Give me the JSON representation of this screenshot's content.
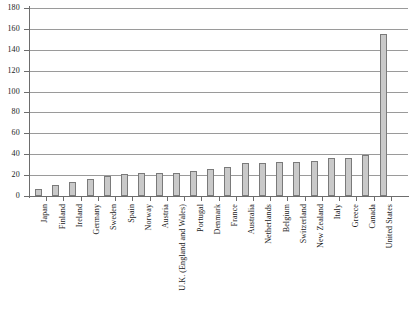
{
  "chart_data": {
    "type": "bar",
    "title": "",
    "subtitle": "",
    "xlabel": "",
    "ylabel": "",
    "ylim": [
      0,
      180
    ],
    "ytick_step": 20,
    "yticks": [
      0,
      20,
      40,
      60,
      80,
      100,
      120,
      140,
      160,
      180
    ],
    "grid": true,
    "legend": "none",
    "orientation": "vertical",
    "bar_fill_color": "#c9c9c9",
    "bar_border_color": "#7a7a7a",
    "axis_color": "#6d6d6d",
    "gridline_color": "#9a9a9a",
    "categories": [
      "Japan",
      "Finland",
      "Ireland",
      "Germany",
      "Sweden",
      "Spain",
      "Norway",
      "Austria",
      "U.K. (England and Wales)",
      "Portugal",
      "Denmark",
      "France",
      "Australia",
      "Netherlands",
      "Belgium",
      "Switzerland",
      "New Zealand",
      "Italy",
      "Greece",
      "Canada",
      "United States"
    ],
    "values": [
      7,
      11,
      13,
      16,
      19,
      21,
      22,
      22,
      22,
      24,
      26,
      28,
      32,
      32,
      33,
      33,
      34,
      36,
      36,
      39,
      155
    ]
  }
}
